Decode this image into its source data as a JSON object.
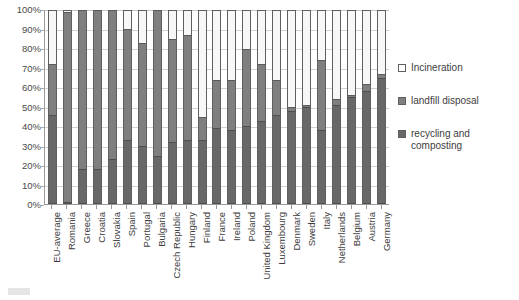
{
  "chart_data": {
    "type": "bar",
    "stacked": true,
    "title": "",
    "xlabel": "",
    "ylabel": "",
    "ylim": [
      0,
      100
    ],
    "y_tick_labels": [
      "100%",
      "90%",
      "80%",
      "70%",
      "60%",
      "50%",
      "40%",
      "30%",
      "20%",
      "10%",
      "0%"
    ],
    "y_tick_values": [
      100,
      90,
      80,
      70,
      60,
      50,
      40,
      30,
      20,
      10,
      0
    ],
    "grid": true,
    "legend_position": "right",
    "categories": [
      "EU-average",
      "Romania",
      "Greece",
      "Croatia",
      "Slovakia",
      "Spain",
      "Portugal",
      "Bulgaria",
      "Czech Republic",
      "Hungary",
      "Finland",
      "France",
      "Ireland",
      "Poland",
      "United Kingdom",
      "Luxembourg",
      "Denmark",
      "Sweden",
      "Italy",
      "Netherlands",
      "Belgium",
      "Austria",
      "Germany"
    ],
    "series": [
      {
        "name": "recycling and composting",
        "color": "#686868",
        "values": [
          46,
          1,
          18,
          18,
          23,
          33,
          30,
          25,
          32,
          33,
          33,
          39,
          38,
          40,
          43,
          46,
          48,
          50,
          38,
          51,
          55,
          58,
          65
        ]
      },
      {
        "name": "landfill disposal",
        "color": "#7f7f7f",
        "values": [
          26,
          98,
          82,
          82,
          77,
          57,
          53,
          75,
          53,
          54,
          12,
          25,
          26,
          40,
          29,
          18,
          2,
          1,
          36,
          3,
          1,
          4,
          2
        ]
      },
      {
        "name": "Incineration",
        "color": "#ffffff",
        "values": [
          28,
          1,
          0,
          0,
          0,
          10,
          17,
          0,
          15,
          13,
          55,
          36,
          36,
          20,
          28,
          36,
          50,
          49,
          26,
          46,
          44,
          38,
          33
        ]
      }
    ],
    "bar_totals": [
      100,
      100,
      100,
      100,
      100,
      100,
      100,
      100,
      100,
      100,
      100,
      100,
      100,
      100,
      100,
      100,
      100,
      100,
      100,
      100,
      100,
      100,
      100
    ]
  },
  "legend": {
    "items": [
      {
        "label": "Incineration",
        "key": "incineration-key"
      },
      {
        "label": "landfill disposal",
        "key": "landfill-key"
      },
      {
        "label": "recycling and composting",
        "key": "recycling-key"
      }
    ]
  },
  "colors": {
    "incineration": "#ffffff",
    "landfill": "#7f7f7f",
    "recycling": "#686868",
    "gridline": "#d2d2d2",
    "axis": "#9a9a9a",
    "text": "#3d3d3d"
  }
}
